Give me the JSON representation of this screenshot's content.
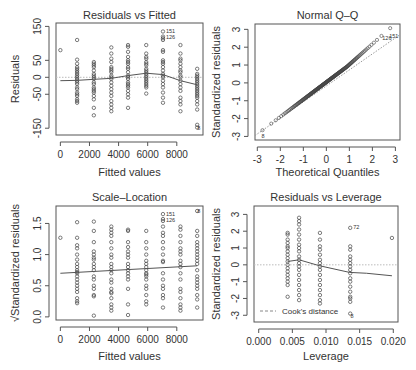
{
  "chart_data": [
    {
      "type": "scatter",
      "title": "Residuals vs Fitted",
      "xlabel": "Fitted values",
      "ylabel": "Residuals",
      "xlim": [
        -300,
        9800
      ],
      "ylim": [
        -170,
        160
      ],
      "xticks": [
        0,
        2000,
        4000,
        6000,
        8000
      ],
      "xtick_labels": [
        "0",
        "2000",
        "4000",
        "6000",
        "8000"
      ],
      "yticks": [
        150,
        50,
        0,
        -50,
        -150
      ],
      "ytick_labels": [
        "150",
        "50",
        "0",
        "-50",
        "-150"
      ],
      "reference_line": {
        "y": 0,
        "style": "dotted",
        "color": "#bbbbbb"
      },
      "smooth": {
        "x": [
          0,
          1150,
          2300,
          3500,
          4650,
          5900,
          7050,
          8250,
          9400
        ],
        "y": [
          -10,
          -9,
          -6,
          -3,
          5,
          12,
          8,
          -10,
          -22
        ]
      },
      "groups": [
        {
          "x": 0,
          "y": [
            80
          ]
        },
        {
          "x": 1150,
          "y": [
            110,
            52,
            40,
            30,
            25,
            20,
            15,
            10,
            5,
            0,
            -5,
            -10,
            -15,
            -20,
            -30,
            -35,
            -45,
            -50,
            -55,
            -65,
            -70,
            -75
          ]
        },
        {
          "x": 2300,
          "y": [
            45,
            40,
            35,
            30,
            20,
            10,
            5,
            0,
            -5,
            -15,
            -20,
            -30,
            -35,
            -40,
            -45,
            -55,
            -65,
            -90,
            -112
          ]
        },
        {
          "x": 3500,
          "y": [
            88,
            70,
            55,
            45,
            30,
            25,
            20,
            15,
            5,
            0,
            -5,
            -15,
            -25,
            -35,
            -45,
            -55,
            -70,
            -80,
            -90,
            -100
          ]
        },
        {
          "x": 4650,
          "y": [
            95,
            90,
            75,
            60,
            50,
            45,
            40,
            30,
            25,
            15,
            5,
            0,
            -5,
            -15,
            -20,
            -25,
            -30,
            -40,
            -50,
            -60,
            -90
          ]
        },
        {
          "x": 5900,
          "y": [
            95,
            70,
            60,
            55,
            45,
            40,
            35,
            25,
            20,
            15,
            10,
            5,
            0,
            -5,
            -10,
            -15,
            -20,
            -25,
            -30,
            -48
          ]
        },
        {
          "x": 7050,
          "y": [
            135,
            120,
            115,
            110,
            80,
            75,
            50,
            45,
            40,
            30,
            20,
            10,
            5,
            0,
            -10,
            -20,
            -30,
            -45,
            -60,
            -75
          ]
        },
        {
          "x": 8250,
          "y": [
            95,
            70,
            55,
            50,
            40,
            30,
            20,
            15,
            5,
            0,
            -10,
            -20,
            -30,
            -40,
            -60,
            -70,
            -80,
            -100
          ]
        },
        {
          "x": 9400,
          "y": [
            25,
            10,
            5,
            0,
            -5,
            -10,
            -15,
            -20,
            -25,
            -30,
            -35,
            -40,
            -45,
            -50,
            -55,
            -60,
            -70,
            -80,
            -95,
            -140,
            -148
          ]
        }
      ],
      "annotations": [
        {
          "label": "151",
          "x": 7050,
          "y": 135
        },
        {
          "label": "126",
          "x": 7050,
          "y": 118
        },
        {
          "label": "8",
          "x": 9200,
          "y": -148
        }
      ]
    },
    {
      "type": "scatter",
      "title": "Normal Q–Q",
      "xlabel": "Theoretical Quantiles",
      "ylabel": "Standardized residuals",
      "xlim": [
        -3.1,
        3.2
      ],
      "ylim": [
        -3.2,
        3.3
      ],
      "xticks": [
        -3,
        -2,
        -1,
        0,
        1,
        2,
        3
      ],
      "xtick_labels": [
        "-3",
        "-2",
        "-1",
        "0",
        "1",
        "2",
        "3"
      ],
      "yticks": [
        3,
        2,
        1,
        0,
        -1,
        -2,
        -3
      ],
      "ytick_labels": [
        "3",
        "2",
        "1",
        "0",
        "-1",
        "-2",
        "-3"
      ],
      "reference_line": {
        "from": [
          -3.1,
          -2.95
        ],
        "to": [
          3.2,
          2.7
        ],
        "style": "dotted",
        "color": "#999999"
      },
      "points_summary": "approximately linear with slight upper-tail lift; sample of ~180 points",
      "annotations": [
        {
          "label": "151",
          "x": 2.6,
          "y": 2.65
        },
        {
          "label": "126",
          "x": 2.3,
          "y": 2.5
        },
        {
          "label": "8",
          "x": -2.95,
          "y": -2.95
        }
      ]
    },
    {
      "type": "scatter",
      "title": "Scale–Location",
      "xlabel": "Fitted values",
      "ylabel": "√Standardized residuals",
      "xlim": [
        -300,
        9800
      ],
      "ylim": [
        -0.05,
        1.78
      ],
      "xticks": [
        0,
        2000,
        4000,
        6000,
        8000
      ],
      "xtick_labels": [
        "0",
        "2000",
        "4000",
        "6000",
        "8000"
      ],
      "yticks": [
        1.5,
        1.0,
        0.5,
        0.0
      ],
      "ytick_labels": [
        "1.5",
        "1.0",
        "0.5",
        "0.0"
      ],
      "smooth": {
        "x": [
          0,
          9400
        ],
        "y": [
          0.7,
          0.82
        ]
      },
      "groups": [
        {
          "x": 0,
          "y": [
            1.27
          ]
        },
        {
          "x": 1150,
          "y": [
            1.52,
            1.27,
            1.15,
            1.1,
            1.0,
            0.92,
            0.85,
            0.8,
            0.75,
            0.72,
            0.7,
            0.65,
            0.6,
            0.55,
            0.5,
            0.45,
            0.4,
            0.3,
            0.25,
            0.22
          ]
        },
        {
          "x": 2300,
          "y": [
            1.53,
            1.38,
            1.2,
            1.05,
            1.0,
            0.95,
            0.92,
            0.85,
            0.8,
            0.75,
            0.65,
            0.6,
            0.5,
            0.45,
            0.35,
            0.33,
            0.02
          ]
        },
        {
          "x": 3500,
          "y": [
            1.45,
            1.4,
            1.35,
            1.3,
            1.2,
            1.1,
            1.0,
            0.95,
            0.85,
            0.8,
            0.75,
            0.7,
            0.6,
            0.55,
            0.45,
            0.4,
            0.38,
            0.3,
            0.2,
            0.15,
            0.1
          ]
        },
        {
          "x": 4650,
          "y": [
            1.4,
            1.38,
            1.2,
            1.12,
            1.05,
            1.0,
            0.95,
            0.85,
            0.8,
            0.75,
            0.7,
            0.65,
            0.6,
            0.45,
            0.2,
            0.03
          ]
        },
        {
          "x": 5900,
          "y": [
            1.38,
            1.2,
            1.1,
            1.0,
            0.9,
            0.85,
            0.8,
            0.75,
            0.7,
            0.68,
            0.65,
            0.6,
            0.5,
            0.45,
            0.35,
            0.25,
            0.2
          ]
        },
        {
          "x": 7050,
          "y": [
            1.65,
            1.57,
            1.54,
            1.45,
            1.35,
            1.3,
            1.2,
            1.1,
            1.0,
            0.9,
            0.88,
            0.7,
            0.6,
            0.5,
            0.45,
            0.35,
            0.3,
            0.15
          ]
        },
        {
          "x": 8250,
          "y": [
            1.45,
            1.4,
            1.3,
            1.2,
            1.1,
            1.05,
            1.0,
            0.9,
            0.85,
            0.8,
            0.7,
            0.6,
            0.45,
            0.4,
            0.3,
            0.2,
            0.15,
            0.1
          ]
        },
        {
          "x": 9400,
          "y": [
            1.7,
            1.38,
            1.3,
            1.2,
            1.15,
            1.1,
            1.05,
            1.0,
            0.95,
            0.9,
            0.85,
            0.75,
            0.65,
            0.6,
            0.55,
            0.5,
            0.45,
            0.35,
            0.28,
            0.15
          ]
        }
      ],
      "annotations": [
        {
          "label": "151",
          "x": 7050,
          "y": 1.65
        },
        {
          "label": "126",
          "x": 7050,
          "y": 1.55
        },
        {
          "label": "8",
          "x": 9200,
          "y": 1.7
        }
      ]
    },
    {
      "type": "scatter",
      "title": "Residuals vs Leverage",
      "xlabel": "Leverage",
      "ylabel": "Standardized residuals",
      "xlim": [
        -0.0007,
        0.0207
      ],
      "ylim": [
        -3.4,
        3.5
      ],
      "xticks": [
        0.0,
        0.005,
        0.01,
        0.015,
        0.02
      ],
      "xtick_labels": [
        "0.000",
        "0.005",
        "0.010",
        "0.015",
        "0.020"
      ],
      "yticks": [
        3,
        2,
        1,
        0,
        -1,
        -2,
        -3
      ],
      "ytick_labels": [
        "3",
        "2",
        "1",
        "0",
        "-1",
        "-2",
        "-3"
      ],
      "reference_line": {
        "y": 0,
        "style": "dotted",
        "color": "#bbbbbb"
      },
      "smooth": {
        "x": [
          0.0043,
          0.006,
          0.009,
          0.0135,
          0.016,
          0.0198
        ],
        "y": [
          0.2,
          0.3,
          -0.05,
          -0.45,
          -0.5,
          -0.65
        ]
      },
      "groups": [
        {
          "x": 0.0043,
          "y": [
            1.9,
            1.8,
            1.5,
            1.3,
            1.1,
            1.0,
            0.8,
            0.6,
            0.4,
            0.2,
            0.0,
            -0.2,
            -0.4,
            -0.6,
            -0.8,
            -1.0,
            -1.2,
            -1.9
          ]
        },
        {
          "x": 0.006,
          "y": [
            2.8,
            2.6,
            2.4,
            2.1,
            1.8,
            1.5,
            1.2,
            1.0,
            0.8,
            0.5,
            0.3,
            0.1,
            -0.1,
            -0.3,
            -0.6,
            -0.9,
            -1.2,
            -1.5,
            -1.8,
            -2.1
          ]
        },
        {
          "x": 0.0091,
          "y": [
            1.9,
            1.5,
            1.1,
            0.9,
            0.6,
            0.3,
            0.1,
            -0.1,
            -0.3,
            -0.6,
            -0.9,
            -1.2,
            -1.5,
            -1.8,
            -2.1,
            -2.3
          ]
        },
        {
          "x": 0.0136,
          "y": [
            2.2,
            1.1,
            0.9,
            0.5,
            0.3,
            0.1,
            -0.1,
            -0.3,
            -0.5,
            -0.8,
            -1.0,
            -1.3,
            -1.6,
            -1.9,
            -2.0,
            -2.2,
            -2.9
          ]
        },
        {
          "x": 0.0198,
          "y": [
            1.6
          ]
        }
      ],
      "annotations": [
        {
          "label": "72",
          "x": 0.0136,
          "y": 2.25
        },
        {
          "label": "8",
          "x": 0.0132,
          "y": -3.05
        }
      ],
      "legend": {
        "label": "Cook's distance",
        "style": "dashed",
        "position": "bottom-left"
      }
    }
  ]
}
